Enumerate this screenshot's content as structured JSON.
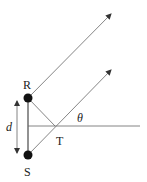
{
  "diagram": {
    "labels": {
      "R": "R",
      "S": "S",
      "T": "T",
      "d": "d",
      "theta": "θ"
    },
    "colors": {
      "line": "#555555",
      "dot": "#111111",
      "text": "#222222"
    }
  }
}
